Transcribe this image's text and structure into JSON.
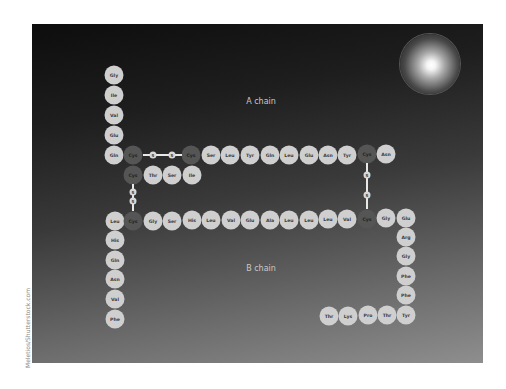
{
  "diagram": {
    "labels": {
      "a_chain": "A chain",
      "b_chain": "B chain"
    },
    "colors": {
      "residue": "#cfcfcf",
      "cysteine": "#555555",
      "bond": "#e8e8e8"
    },
    "watermark": "Meletios/Shutterstock.com",
    "a_chain": [
      {
        "name": "Gly",
        "x": 114,
        "y": 75
      },
      {
        "name": "Ile",
        "x": 114,
        "y": 95
      },
      {
        "name": "Val",
        "x": 114,
        "y": 115
      },
      {
        "name": "Glu",
        "x": 114,
        "y": 135
      },
      {
        "name": "Gln",
        "x": 114,
        "y": 155
      },
      {
        "name": "Cys",
        "x": 133,
        "y": 155,
        "cys": true
      },
      {
        "name": "Cys",
        "x": 191,
        "y": 155,
        "cys": true
      },
      {
        "name": "Ser",
        "x": 211,
        "y": 155
      },
      {
        "name": "Leu",
        "x": 230,
        "y": 155
      },
      {
        "name": "Tyr",
        "x": 250,
        "y": 155
      },
      {
        "name": "Gln",
        "x": 270,
        "y": 155
      },
      {
        "name": "Leu",
        "x": 289,
        "y": 155
      },
      {
        "name": "Glu",
        "x": 309,
        "y": 155
      },
      {
        "name": "Asn",
        "x": 328,
        "y": 155
      },
      {
        "name": "Tyr",
        "x": 347,
        "y": 155
      },
      {
        "name": "Cys",
        "x": 367,
        "y": 154,
        "cys": true
      },
      {
        "name": "Asn",
        "x": 386,
        "y": 154
      },
      {
        "name": "Cys",
        "x": 133,
        "y": 175,
        "cys": true
      },
      {
        "name": "Thr",
        "x": 153,
        "y": 175
      },
      {
        "name": "Ser",
        "x": 172,
        "y": 175
      },
      {
        "name": "Ile",
        "x": 192,
        "y": 175
      }
    ],
    "b_chain": [
      {
        "name": "Leu",
        "x": 115,
        "y": 221
      },
      {
        "name": "Cys",
        "x": 133,
        "y": 221,
        "cys": true
      },
      {
        "name": "Gly",
        "x": 153,
        "y": 221
      },
      {
        "name": "Ser",
        "x": 172,
        "y": 221
      },
      {
        "name": "His",
        "x": 192,
        "y": 220
      },
      {
        "name": "Leu",
        "x": 211,
        "y": 220
      },
      {
        "name": "Val",
        "x": 231,
        "y": 220
      },
      {
        "name": "Glu",
        "x": 250,
        "y": 220
      },
      {
        "name": "Ala",
        "x": 270,
        "y": 220
      },
      {
        "name": "Leu",
        "x": 289,
        "y": 220
      },
      {
        "name": "Leu",
        "x": 309,
        "y": 220
      },
      {
        "name": "Leu",
        "x": 328,
        "y": 219
      },
      {
        "name": "Val",
        "x": 347,
        "y": 219
      },
      {
        "name": "Cys",
        "x": 367,
        "y": 219,
        "cys": true
      },
      {
        "name": "Gly",
        "x": 386,
        "y": 218
      },
      {
        "name": "Glu",
        "x": 406,
        "y": 218
      },
      {
        "name": "Arg",
        "x": 406,
        "y": 237
      },
      {
        "name": "Gly",
        "x": 406,
        "y": 256
      },
      {
        "name": "Phe",
        "x": 406,
        "y": 276
      },
      {
        "name": "Phe",
        "x": 406,
        "y": 295
      },
      {
        "name": "Tyr",
        "x": 406,
        "y": 315
      },
      {
        "name": "Thr",
        "x": 387,
        "y": 315
      },
      {
        "name": "Pro",
        "x": 368,
        "y": 315
      },
      {
        "name": "Lys",
        "x": 348,
        "y": 316
      },
      {
        "name": "Thr",
        "x": 329,
        "y": 316
      },
      {
        "name": "His",
        "x": 115,
        "y": 240
      },
      {
        "name": "Gln",
        "x": 115,
        "y": 260
      },
      {
        "name": "Asn",
        "x": 115,
        "y": 279
      },
      {
        "name": "Val",
        "x": 115,
        "y": 299
      },
      {
        "name": "Phe",
        "x": 115,
        "y": 319
      }
    ],
    "disulfide_bonds": [
      {
        "orientation": "h",
        "x1": 143,
        "y1": 155,
        "x2": 182,
        "y2": 155,
        "s": [
          {
            "x": 153,
            "y": 155
          },
          {
            "x": 172,
            "y": 155
          }
        ]
      },
      {
        "orientation": "v",
        "x1": 133,
        "y1": 184,
        "x2": 133,
        "y2": 211,
        "s": [
          {
            "x": 133,
            "y": 192
          },
          {
            "x": 133,
            "y": 201
          }
        ]
      },
      {
        "orientation": "v",
        "x1": 367,
        "y1": 163,
        "x2": 367,
        "y2": 209,
        "s": [
          {
            "x": 367,
            "y": 175
          },
          {
            "x": 367,
            "y": 195
          }
        ]
      }
    ],
    "s_label": "S"
  }
}
